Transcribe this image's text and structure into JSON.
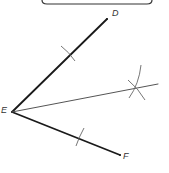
{
  "diagram": {
    "title": "",
    "type": "angle-bisector-construction",
    "colors": {
      "ray": "#1a1a1a",
      "bisector": "#555555",
      "arc": "#666666",
      "label": "#333333",
      "box_border": "#333333"
    },
    "points": {
      "D": {
        "label": "D",
        "x": 107,
        "y": 19
      },
      "E": {
        "label": "E",
        "x": 12,
        "y": 112
      },
      "F": {
        "label": "F",
        "x": 120,
        "y": 155
      },
      "bisector_end": {
        "x": 158,
        "y": 84
      },
      "arc_intersection": {
        "x": 135,
        "y": 87
      }
    },
    "labels": {
      "D": "D",
      "E": "E",
      "F": "F"
    }
  }
}
